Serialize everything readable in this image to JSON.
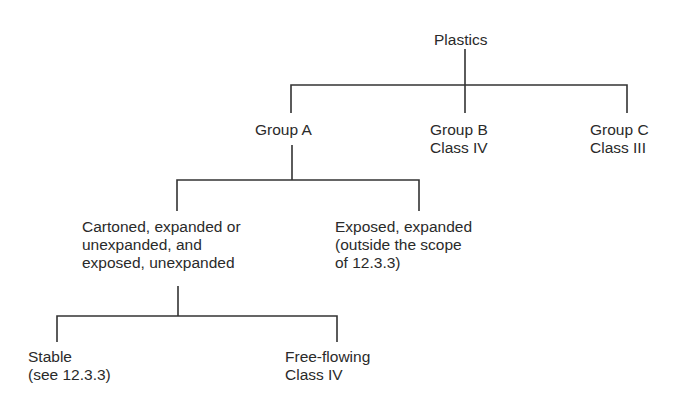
{
  "diagram": {
    "type": "tree",
    "title": "Plastics",
    "root": {
      "label": [
        "Plastics"
      ]
    },
    "level1": [
      {
        "id": "group-a",
        "label": [
          "Group A"
        ]
      },
      {
        "id": "group-b",
        "label": [
          "Group B",
          "Class IV"
        ]
      },
      {
        "id": "group-c",
        "label": [
          "Group C",
          "Class III"
        ]
      }
    ],
    "level2": [
      {
        "id": "cartoned",
        "parent": "group-a",
        "label": [
          "Cartoned, expanded or",
          "unexpanded, and",
          "exposed, unexpanded"
        ]
      },
      {
        "id": "exposed-expanded",
        "parent": "group-a",
        "label": [
          "Exposed, expanded",
          "(outside the scope",
          "of 12.3.3)"
        ]
      }
    ],
    "level3": [
      {
        "id": "stable",
        "parent": "cartoned",
        "label": [
          "Stable",
          "(see 12.3.3)"
        ]
      },
      {
        "id": "free-flowing",
        "parent": "cartoned",
        "label": [
          "Free-flowing",
          "Class IV"
        ]
      }
    ],
    "colors": {
      "text": "#2a2a2a",
      "lines": "#333333",
      "background": "#ffffff"
    }
  }
}
